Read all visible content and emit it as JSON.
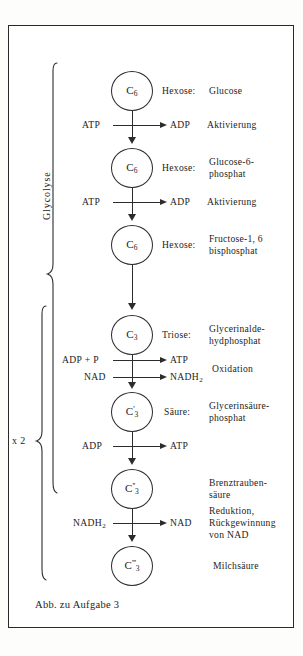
{
  "figure": {
    "caption": "Abb. zu Aufgabe 3",
    "braces": [
      {
        "id": "glycolyse",
        "label": "Glycolyse",
        "orientation": "vertical-rotated"
      },
      {
        "id": "x2",
        "label": "x 2",
        "orientation": "horizontal"
      }
    ],
    "nodes": [
      {
        "id": "glucose",
        "formula_main": "C",
        "formula_sub": "6",
        "formula_prime": "",
        "class_label": "Hexose:",
        "name_lines": [
          "Glucose"
        ]
      },
      {
        "id": "glucose-6-phosphat",
        "formula_main": "C",
        "formula_sub": "6",
        "formula_prime": "",
        "class_label": "Hexose:",
        "name_lines": [
          "Glucose-6-",
          "phosphat"
        ]
      },
      {
        "id": "fructose-1-6-bisphosphat",
        "formula_main": "C",
        "formula_sub": "6",
        "formula_prime": "",
        "class_label": "Hexose:",
        "name_lines": [
          "Fructose-1, 6",
          "bisphosphat"
        ]
      },
      {
        "id": "glycerinaldehydphosphat",
        "formula_main": "C",
        "formula_sub": "3",
        "formula_prime": "",
        "class_label": "Triose:",
        "name_lines": [
          "Glycerinalde-",
          "hydphosphat"
        ]
      },
      {
        "id": "glycerinsaeurephosphat",
        "formula_main": "C",
        "formula_sub": "3",
        "formula_prime": "'",
        "class_label": "Säure:",
        "name_lines": [
          "Glycerinsäure-",
          "phosphat"
        ]
      },
      {
        "id": "brenztraubensaeure",
        "formula_main": "C",
        "formula_sub": "3",
        "formula_prime": "''",
        "class_label": "",
        "name_lines": [
          "Brenztrauben-",
          "säure"
        ]
      },
      {
        "id": "milchsaeure",
        "formula_main": "C",
        "formula_sub": "3",
        "formula_prime": "'''",
        "class_label": "",
        "name_lines": [
          "Milchsäure"
        ]
      }
    ],
    "steps": [
      {
        "id": "step-1-aktivierung",
        "reactants": [
          "ATP"
        ],
        "products": [
          "ADP"
        ],
        "process": "Aktivierung"
      },
      {
        "id": "step-2-aktivierung",
        "reactants": [
          "ATP"
        ],
        "products": [
          "ADP"
        ],
        "process": "Aktivierung"
      },
      {
        "id": "step-3-spaltung",
        "reactants": [],
        "products": [],
        "process": ""
      },
      {
        "id": "step-4-oxidation",
        "reactants": [
          "ADP + P",
          "NAD"
        ],
        "products": [
          "ATP",
          "NADH2"
        ],
        "process": "Oxidation"
      },
      {
        "id": "step-5-atp-gewinn",
        "reactants": [
          "ADP"
        ],
        "products": [
          "ATP"
        ],
        "process": ""
      },
      {
        "id": "step-6-reduktion",
        "reactants": [
          "NADH2"
        ],
        "products": [
          "NAD"
        ],
        "process_lines": [
          "Reduktion,",
          "Rückgewinnung",
          "von NAD"
        ]
      }
    ],
    "cofactor_text": {
      "atp": "ATP",
      "adp": "ADP",
      "adp_plus_p": "ADP + P",
      "nad": "NAD",
      "nadh2_main": "NADH",
      "nadh2_sub": "2"
    },
    "colors": {
      "ink": "#2c2c2c",
      "paper": "#ffffff",
      "frame": "#2a2a2a"
    }
  }
}
